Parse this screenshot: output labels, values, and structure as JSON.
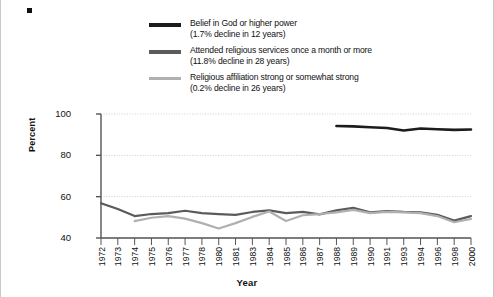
{
  "figure": {
    "corner_mark": "bullet-square"
  },
  "legend": {
    "entries": [
      {
        "label": "Belief in God or higher power",
        "sub": "(1.7% decline in 12 years)",
        "color": "#1c1c1c",
        "swatch": "line-swatch-belief"
      },
      {
        "label": "Attended religious services once a month or more",
        "sub": "(11.8% decline in 28 years)",
        "color": "#5b5b5b",
        "swatch": "line-swatch-attend"
      },
      {
        "label": "Religious affiliation strong or somewhat strong",
        "sub": "(0.2% decline in 26 years)",
        "color": "#b0b0b0",
        "swatch": "line-swatch-affiliation"
      }
    ]
  },
  "chart_data": {
    "type": "line",
    "title": "",
    "xlabel": "Year",
    "ylabel": "Percent",
    "ylim": [
      40,
      100
    ],
    "yticks": [
      40,
      60,
      80,
      100
    ],
    "grid": true,
    "legend_position": "top",
    "categories": [
      "1972",
      "1973",
      "1974",
      "1975",
      "1976",
      "1977",
      "1978",
      "1980",
      "1981",
      "1983",
      "1984",
      "1985",
      "1986",
      "1987",
      "1988",
      "1989",
      "1990",
      "1991",
      "1993",
      "1994",
      "1996",
      "1998",
      "2000"
    ],
    "series": [
      {
        "name": "Belief in God or higher power",
        "color": "#1c1c1c",
        "width": 2.6,
        "values": [
          null,
          null,
          null,
          null,
          null,
          null,
          null,
          null,
          null,
          null,
          null,
          null,
          null,
          null,
          94.2,
          94.0,
          93.6,
          93.2,
          92.0,
          93.0,
          92.6,
          92.3,
          92.5
        ]
      },
      {
        "name": "Attended religious services once a month or more",
        "color": "#5b5b5b",
        "width": 2.2,
        "values": [
          56.8,
          54.0,
          50.6,
          51.6,
          52.0,
          53.2,
          52.0,
          51.6,
          51.2,
          52.6,
          53.4,
          52.0,
          52.6,
          51.4,
          53.4,
          54.6,
          52.4,
          53.0,
          52.6,
          52.4,
          51.2,
          48.4,
          50.6
        ]
      },
      {
        "name": "Religious affiliation strong or somewhat strong",
        "color": "#b0b0b0",
        "width": 2.2,
        "values": [
          null,
          null,
          48.2,
          49.8,
          50.6,
          49.4,
          47.2,
          44.6,
          47.2,
          50.2,
          52.8,
          48.2,
          51.0,
          51.6,
          52.4,
          53.6,
          52.0,
          52.6,
          52.4,
          52.0,
          50.6,
          47.6,
          49.2
        ]
      }
    ]
  }
}
